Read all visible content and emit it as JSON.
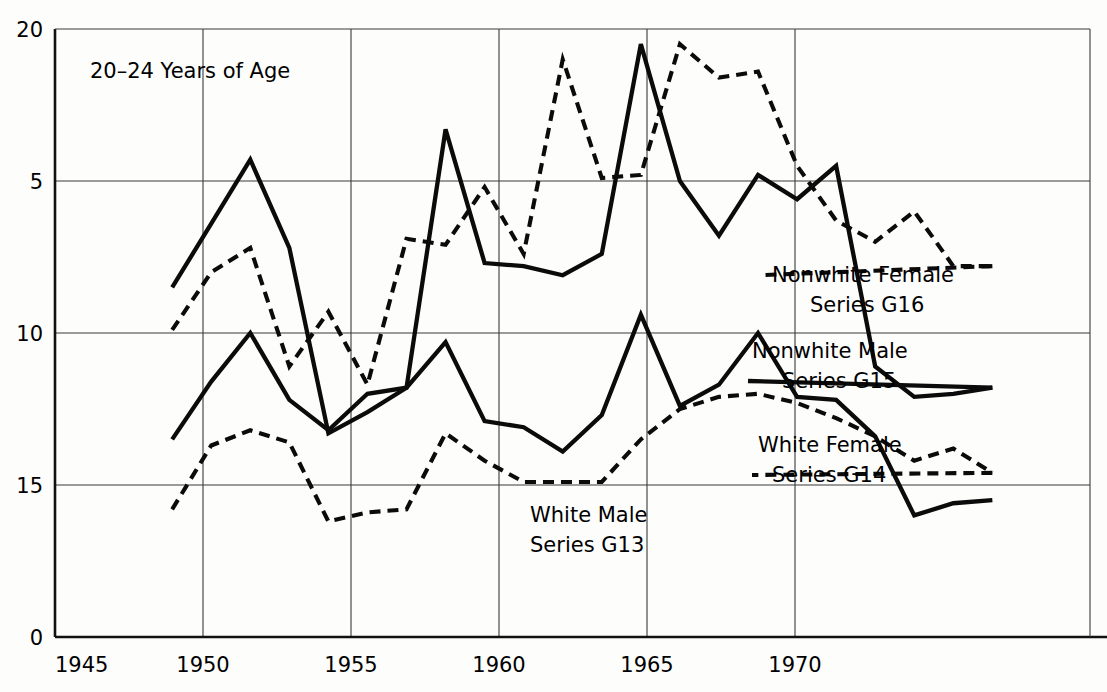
{
  "chart_data": {
    "type": "line",
    "title": "20–24 Years of Age",
    "xlabel": "",
    "ylabel": "",
    "xlim": [
      1945,
      1971.5
    ],
    "ylim": [
      0,
      20
    ],
    "xticks": [
      1945,
      1950,
      1955,
      1960,
      1965,
      1970
    ],
    "xtick_labels": [
      "1945",
      "1950",
      "1955",
      "1960",
      "1965",
      "1970"
    ],
    "yticks": [
      0,
      5,
      10,
      15,
      20
    ],
    "ytick_labels": [
      "0",
      "5",
      "10",
      "15",
      "20"
    ],
    "grid": true,
    "legend_position": "inline-annotations",
    "series": [
      {
        "name": "Nonwhite Female Series G16",
        "label_line1": "Nonwhite Female",
        "label_line2": "Series G16",
        "style": "dashed",
        "x": [
          1948,
          1949,
          1950,
          1951,
          1952,
          1953,
          1954,
          1955,
          1956,
          1957,
          1958,
          1959,
          1960,
          1961,
          1962,
          1963,
          1964,
          1965,
          1966,
          1967,
          1968,
          1969
        ],
        "y": [
          10.1,
          12.0,
          12.8,
          8.9,
          10.7,
          8.3,
          13.1,
          12.9,
          14.8,
          12.6,
          19.0,
          15.1,
          15.2,
          19.5,
          18.4,
          18.6,
          15.5,
          13.7,
          13.0,
          14.0,
          12.2,
          12.2
        ]
      },
      {
        "name": "Nonwhite Male Series G15",
        "label_line1": "Nonwhite Male",
        "label_line2": "Series G15",
        "style": "solid",
        "x": [
          1948,
          1949,
          1950,
          1951,
          1952,
          1953,
          1954,
          1955,
          1956,
          1957,
          1958,
          1959,
          1960,
          1961,
          1962,
          1963,
          1964,
          1965,
          1966,
          1967,
          1968,
          1969
        ],
        "y": [
          11.5,
          13.6,
          15.7,
          12.8,
          6.7,
          7.4,
          8.2,
          16.7,
          12.3,
          12.2,
          11.9,
          12.6,
          19.5,
          15.0,
          13.2,
          15.2,
          14.4,
          15.5,
          8.9,
          7.9,
          8.0,
          8.2
        ]
      },
      {
        "name": "White Female Series G14",
        "label_line1": "White Female",
        "label_line2": "Series G14",
        "style": "dashed",
        "x": [
          1948,
          1949,
          1950,
          1951,
          1952,
          1953,
          1954,
          1955,
          1956,
          1957,
          1958,
          1959,
          1960,
          1961,
          1962,
          1963,
          1964,
          1965,
          1966,
          1967,
          1968,
          1969
        ],
        "y": [
          4.2,
          6.3,
          6.8,
          6.4,
          3.8,
          4.1,
          4.2,
          6.7,
          5.8,
          5.1,
          5.1,
          5.1,
          6.5,
          7.5,
          7.9,
          8.0,
          7.7,
          7.2,
          6.6,
          5.8,
          6.2,
          5.4
        ]
      },
      {
        "name": "White Male Series G13",
        "label_line1": "White Male",
        "label_line2": "Series G13",
        "style": "solid",
        "x": [
          1948,
          1949,
          1950,
          1951,
          1952,
          1953,
          1954,
          1955,
          1956,
          1957,
          1958,
          1959,
          1960,
          1961,
          1962,
          1963,
          1964,
          1965,
          1966,
          1967,
          1968,
          1969
        ],
        "y": [
          6.5,
          8.4,
          10.0,
          7.8,
          6.8,
          8.0,
          8.2,
          9.7,
          7.1,
          6.9,
          6.1,
          7.3,
          10.6,
          7.6,
          8.3,
          10.0,
          7.9,
          7.8,
          6.6,
          4.0,
          4.4,
          4.5
        ]
      }
    ],
    "annotations": [
      {
        "text": "20–24 Years of Age",
        "role": "in-plot-title"
      }
    ]
  }
}
